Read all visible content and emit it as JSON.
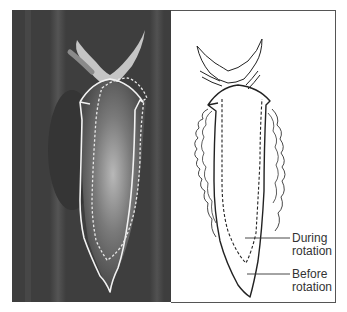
{
  "figure": {
    "photo_panel": {
      "subject": "sea slug photograph with outline overlays",
      "outline_solid": "before rotation",
      "outline_dashed": "during rotation"
    },
    "drawing_panel": {
      "subject": "line drawing of sea slug",
      "labels": [
        {
          "line1": "During",
          "line2": "rotation"
        },
        {
          "line1": "Before",
          "line2": "rotation"
        }
      ]
    },
    "colors": {
      "photo_bg": "#3e3e3e",
      "outline_photo": "#f2f2f2",
      "outline_drawing": "#222222",
      "frame": "#555555"
    }
  }
}
